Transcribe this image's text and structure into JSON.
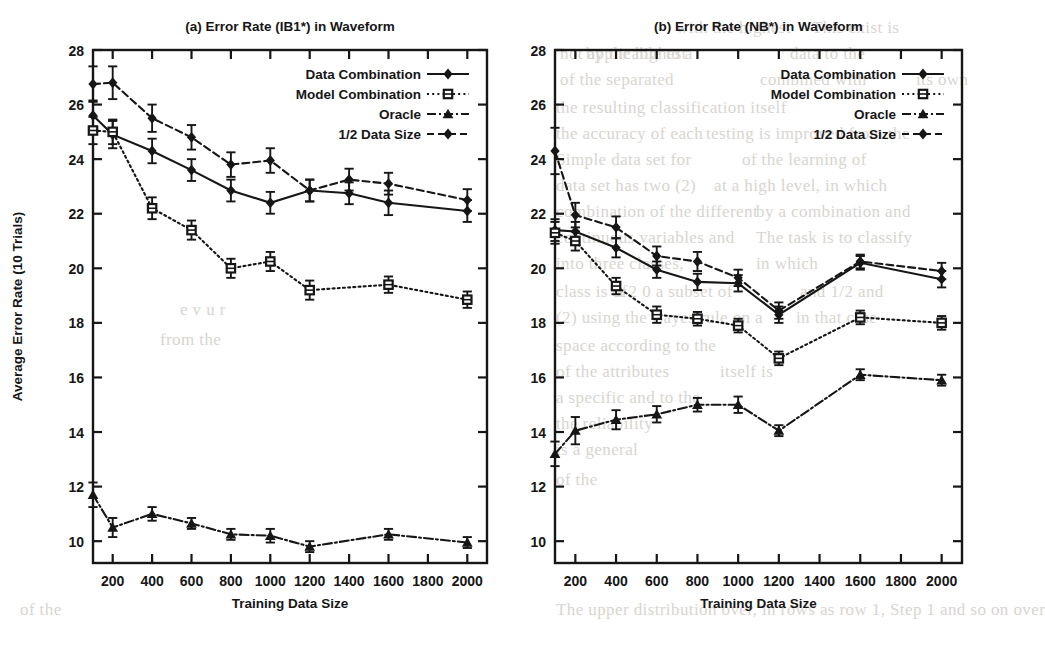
{
  "figure": {
    "background_color": "#ffffff",
    "ink_color": "#161616"
  },
  "bleed_text": [
    {
      "t": "with the highest",
      "x": 676,
      "y": 18
    },
    {
      "t": "This exist is",
      "x": 812,
      "y": 18
    },
    {
      "t": "not applicable to a",
      "x": 560,
      "y": 44
    },
    {
      "t": "by the highest",
      "x": 586,
      "y": 44
    },
    {
      "t": "data to the",
      "x": 790,
      "y": 44
    },
    {
      "t": "of the separated",
      "x": 560,
      "y": 70
    },
    {
      "t": "combined with",
      "x": 760,
      "y": 70
    },
    {
      "t": "its own",
      "x": 916,
      "y": 70
    },
    {
      "t": "the resulting classification itself",
      "x": 556,
      "y": 98
    },
    {
      "t": "the accuracy of each",
      "x": 556,
      "y": 124
    },
    {
      "t": "testing is improved from the",
      "x": 706,
      "y": 124
    },
    {
      "t": "Simple data set for",
      "x": 556,
      "y": 150
    },
    {
      "t": "of the learning of",
      "x": 742,
      "y": 150
    },
    {
      "t": "data set has two (2)",
      "x": 556,
      "y": 176
    },
    {
      "t": "at a high level, in which",
      "x": 714,
      "y": 176
    },
    {
      "t": "combination of the different",
      "x": 556,
      "y": 202
    },
    {
      "t": "by a combination and",
      "x": 756,
      "y": 202
    },
    {
      "t": "continuous variables and",
      "x": 556,
      "y": 228
    },
    {
      "t": "The task is to classify",
      "x": 756,
      "y": 228
    },
    {
      "t": "into three classes,",
      "x": 556,
      "y": 254
    },
    {
      "t": "in which",
      "x": 756,
      "y": 254
    },
    {
      "t": "class is of",
      "x": 556,
      "y": 282
    },
    {
      "t": "a 2 0 a subset of",
      "x": 616,
      "y": 282
    },
    {
      "t": "and 1/2 and",
      "x": 800,
      "y": 282
    },
    {
      "t": "(2) using the Bayes rule on a",
      "x": 556,
      "y": 308
    },
    {
      "t": "in that case",
      "x": 796,
      "y": 308
    },
    {
      "t": "space according to the",
      "x": 556,
      "y": 336
    },
    {
      "t": "of the attributes",
      "x": 556,
      "y": 362
    },
    {
      "t": "itself is",
      "x": 720,
      "y": 362
    },
    {
      "t": "a specific and to the",
      "x": 556,
      "y": 388
    },
    {
      "t": "the reliability",
      "x": 556,
      "y": 414
    },
    {
      "t": "is a general",
      "x": 556,
      "y": 440
    },
    {
      "t": "of the",
      "x": 556,
      "y": 470
    },
    {
      "t": "The upper distribution over, in rows as row 1, Step 1 and so on over",
      "x": 556,
      "y": 600
    },
    {
      "t": "of the",
      "x": 20,
      "y": 600
    },
    {
      "t": "e v u r",
      "x": 180,
      "y": 300
    },
    {
      "t": "from the",
      "x": 160,
      "y": 330
    }
  ],
  "panels": [
    {
      "id": "a",
      "title": "(a) Error Rate (IB1*) in Waveform",
      "xlabel": "Training Data Size",
      "ylabel": "Average Error Rate (10 Trials)",
      "show_ylabel": true,
      "xticks": [
        200,
        400,
        600,
        800,
        1000,
        1200,
        1400,
        1600,
        1800,
        2000
      ],
      "yticks": [
        10,
        12,
        14,
        16,
        18,
        20,
        22,
        24,
        26,
        28
      ],
      "xlim": [
        100,
        2100
      ],
      "ylim": [
        9.2,
        28
      ]
    },
    {
      "id": "b",
      "title": "(b) Error Rate (NB*) in Waveform",
      "xlabel": "Training Data Size",
      "ylabel": "",
      "show_ylabel": false,
      "xticks": [
        200,
        400,
        600,
        800,
        1000,
        1200,
        1400,
        1600,
        1800,
        2000
      ],
      "yticks": [
        10,
        12,
        14,
        16,
        18,
        20,
        22,
        24,
        26,
        28
      ],
      "xlim": [
        100,
        2100
      ],
      "ylim": [
        9.2,
        28
      ]
    }
  ],
  "legend": {
    "position": "top-right",
    "entries": [
      {
        "label": "Data Combination",
        "marker": "diamond",
        "line": "solid"
      },
      {
        "label": "Model Combination",
        "marker": "square",
        "line": "dotted"
      },
      {
        "label": "Oracle",
        "marker": "triangle",
        "line": "dashdot"
      },
      {
        "label": "1/2 Data Size",
        "marker": "diamond",
        "line": "dashed"
      }
    ]
  },
  "chart_data": [
    {
      "type": "line",
      "panel": "a",
      "title": "(a) Error Rate (IB1*) in Waveform",
      "xlabel": "Training Data Size",
      "ylabel": "Average Error Rate (10 Trials)",
      "xlim": [
        100,
        2100
      ],
      "ylim": [
        9.2,
        28
      ],
      "xticks": [
        200,
        400,
        600,
        800,
        1000,
        1200,
        1400,
        1600,
        1800,
        2000
      ],
      "yticks": [
        10,
        12,
        14,
        16,
        18,
        20,
        22,
        24,
        26,
        28
      ],
      "grid": false,
      "errorbars": true,
      "x": [
        100,
        200,
        400,
        600,
        800,
        1000,
        1200,
        1400,
        1600,
        2000
      ],
      "series": [
        {
          "name": "Data Combination",
          "marker": "diamond",
          "line": "solid",
          "values": [
            25.6,
            24.9,
            24.3,
            23.6,
            22.85,
            22.4,
            22.85,
            22.75,
            22.4,
            22.1
          ],
          "errors": [
            0.55,
            0.5,
            0.45,
            0.4,
            0.4,
            0.4,
            0.4,
            0.4,
            0.45,
            0.4
          ]
        },
        {
          "name": "Model Combination",
          "marker": "square",
          "line": "dotted",
          "values": [
            25.05,
            25.0,
            22.2,
            21.4,
            20.0,
            20.25,
            19.2,
            null,
            19.4,
            18.85
          ],
          "errors": [
            0.5,
            0.45,
            0.4,
            0.35,
            0.35,
            0.35,
            0.35,
            null,
            0.3,
            0.3
          ]
        },
        {
          "name": "Oracle",
          "marker": "triangle",
          "line": "dashdot",
          "values": [
            11.7,
            10.5,
            11.0,
            10.65,
            10.25,
            10.2,
            9.8,
            null,
            10.25,
            9.95
          ],
          "errors": [
            0.45,
            0.35,
            0.25,
            0.2,
            0.2,
            0.25,
            0.2,
            null,
            0.2,
            0.2
          ]
        },
        {
          "name": "1/2 Data Size",
          "marker": "diamond",
          "line": "dashed",
          "values": [
            26.75,
            26.8,
            25.5,
            24.8,
            23.8,
            23.95,
            22.85,
            23.25,
            23.1,
            22.5
          ],
          "errors": [
            0.65,
            0.6,
            0.5,
            0.45,
            0.45,
            0.45,
            0.4,
            0.4,
            0.4,
            0.4
          ]
        }
      ]
    },
    {
      "type": "line",
      "panel": "b",
      "title": "(b) Error Rate (NB*) in Waveform",
      "xlabel": "Training Data Size",
      "ylabel": "",
      "xlim": [
        100,
        2100
      ],
      "ylim": [
        9.2,
        28
      ],
      "xticks": [
        200,
        400,
        600,
        800,
        1000,
        1200,
        1400,
        1600,
        1800,
        2000
      ],
      "yticks": [
        10,
        12,
        14,
        16,
        18,
        20,
        22,
        24,
        26,
        28
      ],
      "grid": false,
      "errorbars": true,
      "x": [
        100,
        200,
        400,
        600,
        800,
        1000,
        1200,
        1400,
        1600,
        2000
      ],
      "series": [
        {
          "name": "Data Combination",
          "marker": "diamond",
          "line": "solid",
          "values": [
            21.4,
            21.35,
            20.75,
            19.95,
            19.5,
            19.45,
            18.3,
            null,
            20.2,
            19.6
          ],
          "errors": [
            0.4,
            0.35,
            0.35,
            0.3,
            0.3,
            0.3,
            0.3,
            null,
            0.25,
            0.3
          ]
        },
        {
          "name": "Model Combination",
          "marker": "square",
          "line": "dotted",
          "values": [
            21.3,
            21.0,
            19.35,
            18.3,
            18.15,
            17.9,
            16.7,
            null,
            18.2,
            18.0
          ],
          "errors": [
            0.4,
            0.35,
            0.3,
            0.3,
            0.25,
            0.25,
            0.25,
            null,
            0.25,
            0.25
          ]
        },
        {
          "name": "Oracle",
          "marker": "triangle",
          "line": "dashdot",
          "values": [
            13.2,
            14.05,
            14.45,
            14.65,
            15.0,
            15.0,
            14.05,
            null,
            16.1,
            15.9
          ],
          "errors": [
            0.45,
            0.5,
            0.35,
            0.3,
            0.25,
            0.3,
            0.2,
            null,
            0.2,
            0.2
          ]
        },
        {
          "name": "1/2 Data Size",
          "marker": "diamond",
          "line": "dashed",
          "values": [
            24.3,
            21.95,
            21.5,
            20.45,
            20.25,
            19.65,
            18.45,
            null,
            20.25,
            19.9
          ],
          "errors": [
            0.85,
            0.45,
            0.4,
            0.35,
            0.35,
            0.3,
            0.3,
            null,
            0.25,
            0.3
          ]
        }
      ]
    }
  ]
}
